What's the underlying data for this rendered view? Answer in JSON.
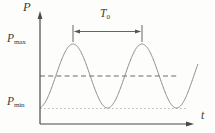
{
  "labels": {
    "y_axis": "P",
    "x_axis": "t",
    "p_max": {
      "base": "P",
      "sub": "max"
    },
    "p_min": {
      "base": "P",
      "sub": "min"
    },
    "period": {
      "base": "T",
      "sub": "0"
    }
  },
  "colors": {
    "axis": "#4a4a4a",
    "curve": "#8c8c8c",
    "dashed_mean": "#6b6b6b",
    "dotted_min": "#bdbdbd",
    "marker": "#555555",
    "background": "#fdfdfc"
  },
  "geometry": {
    "axis": {
      "x": 40,
      "y_top": 16,
      "y_bottom": 124,
      "x_right": 188
    },
    "wave": {
      "x_start": 40,
      "x_end": 198,
      "mean_y": 76,
      "amplitude": 32,
      "period": 69,
      "first_peak_x": 73
    },
    "mean_line": {
      "y": 76,
      "x1": 40,
      "x2": 178
    },
    "min_line": {
      "y": 108.5,
      "x1": 40,
      "x2": 186
    },
    "period_marker": {
      "x1": 73,
      "x2": 142,
      "tick_top": 25,
      "tick_bottom": 42,
      "arrow_y": 31.5
    }
  },
  "chart_data": {
    "type": "line",
    "title": "",
    "xlabel": "t",
    "ylabel": "P",
    "grid": false,
    "legend": "none",
    "annotations": [
      "P_max at peak level",
      "P_min at trough level (dotted guide line)",
      "mean pressure dashed guide line",
      "T_0 period bracket spanning one full cycle between the two peaks"
    ],
    "series": [
      {
        "name": "pressure wave",
        "shape": "sinusoid",
        "cycles_shown": 2.3,
        "peaks_x_px": [
          73,
          142
        ],
        "troughs_x_px": [
          40,
          107.5,
          176.5
        ],
        "mean_y_px": 76,
        "amplitude_px": 32,
        "period_px": 69,
        "p_max_level_y_px": 44,
        "p_min_level_y_px": 108
      }
    ]
  }
}
